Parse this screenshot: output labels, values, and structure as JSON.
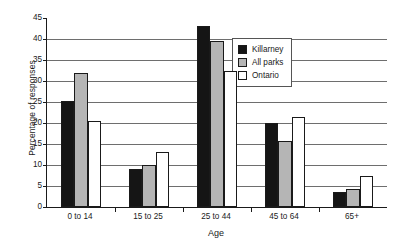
{
  "chart_data": {
    "type": "bar",
    "title": "",
    "xlabel": "Age",
    "ylabel": "Percentage of responses",
    "categories": [
      "0 to 14",
      "15 to 25",
      "25 to 44",
      "45 to 64",
      "65+"
    ],
    "series": [
      {
        "name": "Killarney",
        "color": "#151515",
        "values": [
          25.3,
          9.0,
          43.2,
          20.0,
          3.5
        ]
      },
      {
        "name": "All parks",
        "color": "#b5b5b5",
        "values": [
          32.0,
          10.0,
          39.5,
          15.8,
          4.3
        ]
      },
      {
        "name": "Ontario",
        "color": "#ffffff",
        "values": [
          20.5,
          13.0,
          32.5,
          21.5,
          7.5
        ]
      }
    ],
    "ylim": [
      0,
      45
    ],
    "yticks": [
      0,
      5,
      10,
      15,
      20,
      25,
      30,
      35,
      40,
      45
    ],
    "ytick_labels": [
      "0",
      "5",
      "10",
      "15",
      "20",
      "25",
      "30",
      "35",
      "40",
      "45"
    ],
    "grid": "horizontal",
    "legend_position": "upper-right"
  },
  "legend": {
    "entries": [
      {
        "label": "Killarney",
        "swatch": "black-square-swatch"
      },
      {
        "label": "All parks",
        "swatch": "gray-square-swatch"
      },
      {
        "label": "Ontario",
        "swatch": "white-square-swatch"
      }
    ]
  }
}
